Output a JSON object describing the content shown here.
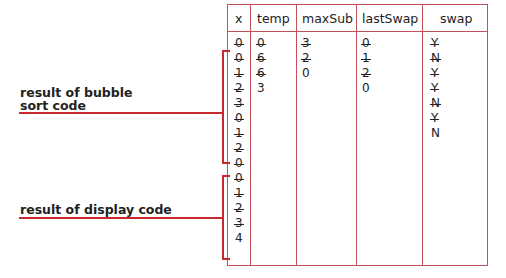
{
  "table": {
    "columns": [
      "x",
      "temp",
      "maxSub",
      "lastSwap",
      "swap"
    ],
    "x": [
      {
        "v": "0",
        "struck": true
      },
      {
        "v": "0",
        "struck": true
      },
      {
        "v": "1",
        "struck": true
      },
      {
        "v": "2",
        "struck": true
      },
      {
        "v": "3",
        "struck": true
      },
      {
        "v": "0",
        "struck": true
      },
      {
        "v": "1",
        "struck": true
      },
      {
        "v": "2",
        "struck": true
      },
      {
        "v": "0",
        "struck": true
      },
      {
        "v": "0",
        "struck": true
      },
      {
        "v": "1",
        "struck": true
      },
      {
        "v": "2",
        "struck": true
      },
      {
        "v": "3",
        "struck": true
      },
      {
        "v": "4",
        "struck": false
      }
    ],
    "temp": [
      {
        "v": "0",
        "struck": true
      },
      {
        "v": "6",
        "struck": true
      },
      {
        "v": "6",
        "struck": true
      },
      {
        "v": "3",
        "struck": false
      }
    ],
    "maxSub": [
      {
        "v": "3",
        "struck": true
      },
      {
        "v": "2",
        "struck": true
      },
      {
        "v": "0",
        "struck": false
      }
    ],
    "lastSwap": [
      {
        "v": "0",
        "struck": true
      },
      {
        "v": "1",
        "struck": true
      },
      {
        "v": "2",
        "struck": true
      },
      {
        "v": "0",
        "struck": false
      }
    ],
    "swap": [
      {
        "v": "Y",
        "struck": true
      },
      {
        "v": "N",
        "struck": true
      },
      {
        "v": "Y",
        "struck": true
      },
      {
        "v": "Y",
        "struck": true
      },
      {
        "v": "N",
        "struck": true
      },
      {
        "v": "Y",
        "struck": true
      },
      {
        "v": "N",
        "struck": false
      }
    ]
  },
  "annotations": {
    "bubble_line1": "result of bubble",
    "bubble_line2": "sort code",
    "display": "result of display code"
  },
  "colors": {
    "grid": "#c4505a",
    "bracket": "#c8282e"
  }
}
